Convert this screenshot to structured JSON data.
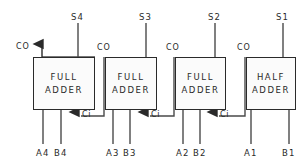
{
  "diagram": {
    "wire_color": "#4a4a4a",
    "box_border_color": "#2a2a2a",
    "text_color": "#2a2a2a",
    "background": "#ffffff",
    "final_carry_out_label": "CO",
    "stages": [
      {
        "id": "stage-4",
        "block_line1": "FULL",
        "block_line2": "ADDER",
        "sum_label": "S4",
        "carry_out_label": "CO",
        "carry_in_label": "Ci",
        "input_a_label": "A4",
        "input_b_label": "B4",
        "box": {
          "x": 33,
          "y": 57,
          "w": 62,
          "h": 53
        },
        "sum_line_x": 78,
        "input_a_x": 43,
        "input_b_x": 61,
        "carry_in_x": 78,
        "carry_out_x": 42
      },
      {
        "id": "stage-3",
        "block_line1": "FULL",
        "block_line2": "ADDER",
        "sum_label": "S3",
        "carry_out_label": "CO",
        "carry_in_label": "Ci",
        "input_a_label": "A3",
        "input_b_label": "B3",
        "box": {
          "x": 105,
          "y": 57,
          "w": 52,
          "h": 53
        },
        "sum_line_x": 146,
        "input_a_x": 113,
        "input_b_x": 130,
        "carry_in_x": 147,
        "carry_out_x": 104
      },
      {
        "id": "stage-2",
        "block_line1": "FULL",
        "block_line2": "ADDER",
        "sum_label": "S2",
        "carry_out_label": "CO",
        "carry_in_label": "Ci",
        "input_a_label": "A2",
        "input_b_label": "B2",
        "box": {
          "x": 175,
          "y": 57,
          "w": 51,
          "h": 53
        },
        "sum_line_x": 215,
        "input_a_x": 183,
        "input_b_x": 200,
        "carry_in_x": 216,
        "carry_out_x": 174
      },
      {
        "id": "stage-1",
        "block_line1": "HALF",
        "block_line2": "ADDER",
        "sum_label": "S1",
        "carry_out_label": "CO",
        "carry_in_label": "",
        "input_a_label": "A1",
        "input_b_label": "B1",
        "box": {
          "x": 246,
          "y": 57,
          "w": 50,
          "h": 53
        },
        "sum_line_x": 283,
        "input_a_x": 251,
        "input_b_x": 289,
        "carry_in_x": null,
        "carry_out_x": 245
      }
    ]
  }
}
